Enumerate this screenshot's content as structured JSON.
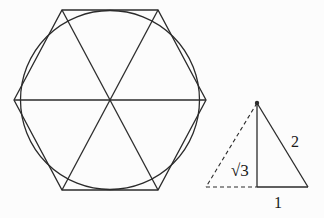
{
  "figure": {
    "background_color": "#fcfcfc",
    "line_color": "#2b2b2b",
    "labels": {
      "triangle_height": "√3",
      "triangle_hypotenuse": "2",
      "triangle_base": "1"
    }
  }
}
